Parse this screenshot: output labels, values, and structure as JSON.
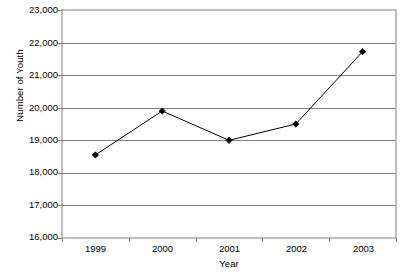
{
  "chart_data": {
    "type": "line",
    "title": "",
    "xlabel": "Year",
    "ylabel": "Number of Youth",
    "categories": [
      "1999",
      "2000",
      "2001",
      "2002",
      "2003"
    ],
    "values": [
      18550,
      19900,
      19000,
      19500,
      21720
    ],
    "series": [
      {
        "name": "Number of Youth",
        "values": [
          18550,
          19900,
          19000,
          19500,
          21720
        ]
      }
    ],
    "ylim": [
      16000,
      23000
    ],
    "ytick_labels": [
      "23,000",
      "22,000",
      "21,000",
      "20,000",
      "19,000",
      "18,000",
      "17,000",
      "16,000"
    ],
    "ytick_values": [
      23000,
      22000,
      21000,
      20000,
      19000,
      18000,
      17000,
      16000
    ],
    "ytick_step": 1000,
    "grid": "horizontal",
    "legend": "none",
    "marker": "diamond",
    "line_color": "#000000",
    "marker_color": "#000000",
    "grid_color": "#808080",
    "axis_color": "#808080",
    "background": "#ffffff"
  }
}
